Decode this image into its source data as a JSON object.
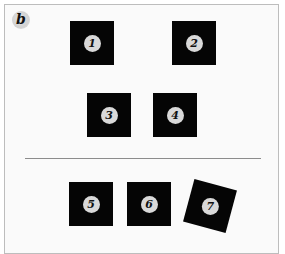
{
  "panel": {
    "label": "b"
  },
  "top_group": {
    "squares": [
      {
        "id": "1",
        "label": "1",
        "rotation_deg": 0
      },
      {
        "id": "2",
        "label": "2",
        "rotation_deg": 0
      },
      {
        "id": "3",
        "label": "3",
        "rotation_deg": 0
      },
      {
        "id": "4",
        "label": "4",
        "rotation_deg": 0
      }
    ]
  },
  "bottom_group": {
    "squares": [
      {
        "id": "5",
        "label": "5",
        "rotation_deg": 0
      },
      {
        "id": "6",
        "label": "6",
        "rotation_deg": 0
      },
      {
        "id": "7",
        "label": "7",
        "rotation_deg": 15
      }
    ]
  },
  "colors": {
    "square_fill": "#050505",
    "badge_fill": "#d9d9d9",
    "divider": "#8c8c8c",
    "frame_border": "#bdbdbd",
    "background": "#fafafa"
  }
}
